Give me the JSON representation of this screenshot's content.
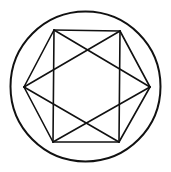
{
  "diagram": {
    "type": "geometric-figure",
    "stroke_color": "#111111",
    "background_color": "#ffffff",
    "circle": {
      "cx": 85.5,
      "cy": 86.5,
      "r": 75,
      "stroke_width": 2
    },
    "vertices": {
      "top_left": [
        54,
        30
      ],
      "top_right": [
        120,
        31
      ],
      "right": [
        150,
        87
      ],
      "bottom_right": [
        119,
        142
      ],
      "bottom_left": [
        53,
        142
      ],
      "left": [
        24,
        87
      ]
    },
    "segments": [
      {
        "name": "hexagon-edge-top",
        "from": "top_left",
        "to": "top_right"
      },
      {
        "name": "hexagon-edge-top-right",
        "from": "top_right",
        "to": "right"
      },
      {
        "name": "hexagon-edge-bottom-right",
        "from": "right",
        "to": "bottom_right"
      },
      {
        "name": "hexagon-edge-bottom",
        "from": "bottom_right",
        "to": "bottom_left"
      },
      {
        "name": "hexagon-edge-bottom-left",
        "from": "bottom_left",
        "to": "left"
      },
      {
        "name": "hexagon-edge-top-left",
        "from": "left",
        "to": "top_left"
      },
      {
        "name": "rectangle-edge-left",
        "from": "top_left",
        "to": "bottom_left"
      },
      {
        "name": "rectangle-edge-right",
        "from": "top_right",
        "to": "bottom_right"
      },
      {
        "name": "diagonal-top-left-to-right",
        "from": "top_left",
        "to": "right"
      },
      {
        "name": "diagonal-top-right-to-left",
        "from": "top_right",
        "to": "left"
      },
      {
        "name": "diagonal-left-to-bottom-right",
        "from": "left",
        "to": "bottom_right"
      },
      {
        "name": "diagonal-right-to-bottom-left",
        "from": "right",
        "to": "bottom_left"
      }
    ],
    "line_stroke_width": 1.6
  }
}
